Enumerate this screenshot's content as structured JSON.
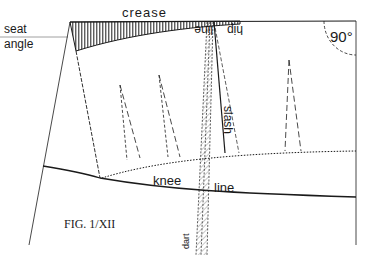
{
  "figure": {
    "caption": "FIG. 1/XII",
    "angle_label": "90°",
    "labels": {
      "crease": "crease",
      "seat": "seat",
      "angle": "angle",
      "line_upside": "line",
      "hip_upside": "hip",
      "slash": "slash",
      "knee": "knee",
      "knee_line": "line",
      "dart": "dart"
    },
    "colors": {
      "ink": "#1a1a1a",
      "paper": "#ffffff"
    }
  }
}
